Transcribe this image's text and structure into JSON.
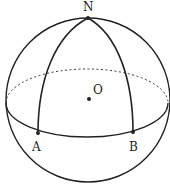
{
  "diagram": {
    "type": "sphere-geometry",
    "colors": {
      "stroke": "#222222",
      "background": "#ffffff"
    },
    "sphere": {
      "cx": 88,
      "cy": 100,
      "r": 82
    },
    "equator": {
      "cx": 87,
      "cy": 103,
      "rx": 81,
      "ry": 34,
      "back_dashed": true
    },
    "points": [
      {
        "id": "N",
        "label": "N",
        "x": 88,
        "y": 18,
        "label_x": 83,
        "label_y": 11
      },
      {
        "id": "O",
        "label": "O",
        "x": 89,
        "y": 99,
        "label_x": 93,
        "label_y": 94
      },
      {
        "id": "A",
        "label": "A",
        "x": 38,
        "y": 133,
        "label_x": 32,
        "label_y": 151
      },
      {
        "id": "B",
        "label": "B",
        "x": 133,
        "y": 132,
        "label_x": 129,
        "label_y": 151
      }
    ],
    "arcs": [
      {
        "from": "N",
        "to": "A",
        "kind": "meridian"
      },
      {
        "from": "N",
        "to": "B",
        "kind": "meridian"
      }
    ]
  }
}
